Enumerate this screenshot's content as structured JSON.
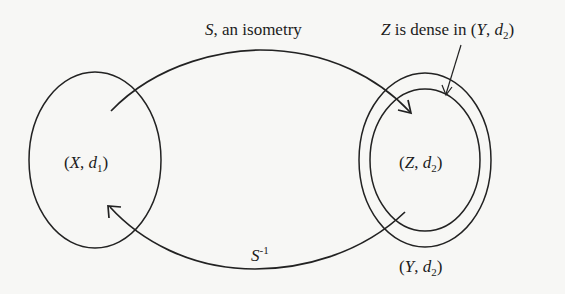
{
  "diagram": {
    "top_arrow_label": {
      "var": "S",
      "text": ", an isometry"
    },
    "bottom_arrow_label": {
      "var": "S",
      "sup": "-1"
    },
    "annotation": {
      "var": "Z",
      "text": " is dense in (",
      "var2": "Y",
      "sep": ", ",
      "var3": "d",
      "sub": "2",
      "close": ")"
    },
    "left_set": {
      "open": "(",
      "var": "X",
      "sep": ", ",
      "var2": "d",
      "sub": "1",
      "close": ")"
    },
    "inner_set": {
      "open": "(",
      "var": "Z",
      "sep": ", ",
      "var2": "d",
      "sub": "2",
      "close": ")"
    },
    "outer_set": {
      "open": "(",
      "var": "Y",
      "sep": ", ",
      "var2": "d",
      "sub": "2",
      "close": ")"
    },
    "stroke_color": "#222222",
    "background_color": "#f7f7f5"
  }
}
